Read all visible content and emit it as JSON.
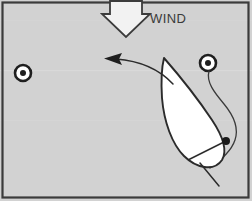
{
  "diagram": {
    "background_color": "#d2d2d2",
    "frame_color": "#3b3b3b",
    "ink_color": "#2b2b2b",
    "hull_fill": "#ffffff",
    "labels": {
      "wind": "WIND"
    },
    "elements": {
      "wind_arrow": {
        "name": "wind-arrow",
        "direction": "down",
        "fill": "#ffffff",
        "stroke": "#3b3b3b"
      },
      "mark_left": {
        "name": "buoy-mark-left",
        "cx": 23,
        "cy": 73,
        "outer_r": 8,
        "inner_r": 3,
        "ring_color": "#1f1f1f",
        "center_color": "#1f1f1f",
        "fill": "#ffffff"
      },
      "mark_right": {
        "name": "buoy-mark-right",
        "cx": 208,
        "cy": 63,
        "outer_r": 8,
        "inner_r": 3,
        "ring_color": "#1f1f1f",
        "center_color": "#1f1f1f",
        "fill": "#ffffff"
      },
      "course_arrow": {
        "name": "course-direction-arrow",
        "direction": "left",
        "stroke": "#2b2b2b"
      },
      "boat": {
        "name": "boat-hull",
        "fill": "#ffffff",
        "stroke": "#2b2b2b",
        "heading": "upwind-port"
      },
      "crew_dot": {
        "name": "crew-position-dot",
        "cx": 226,
        "cy": 141,
        "r": 4,
        "color": "#1a1a1a"
      },
      "tiller": {
        "name": "tiller-line",
        "stroke": "#2b2b2b"
      },
      "track_line": {
        "name": "boat-track-line",
        "stroke": "#3a3a3a"
      }
    }
  }
}
